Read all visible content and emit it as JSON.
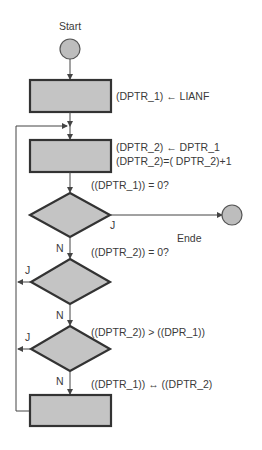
{
  "diagram": {
    "type": "flowchart",
    "colors": {
      "shape_fill": "#c4c4c4",
      "shape_stroke": "#333333",
      "circle_fill": "#bdbdbd",
      "line": "#444444",
      "text": "#3a3a3a"
    },
    "start": {
      "label": "Start"
    },
    "end": {
      "label": "Ende"
    },
    "steps": [
      {
        "id": "box1",
        "kind": "process",
        "lines": [
          "(DPTR_1)  ← LIANF"
        ]
      },
      {
        "id": "box2",
        "kind": "process",
        "lines": [
          "(DPTR_2)  ← DPTR_1",
          "(DPTR_2)=( DPTR_2)+1"
        ]
      },
      {
        "id": "dec1",
        "kind": "decision",
        "condition": "((DPTR_1)) = 0?",
        "yes_label": "J",
        "no_label": "N"
      },
      {
        "id": "dec2",
        "kind": "decision",
        "condition": "((DPTR_2)) = 0?",
        "yes_label": "J",
        "no_label": "N"
      },
      {
        "id": "dec3",
        "kind": "decision",
        "condition": "((DPTR_2)) > ((DPR_1))",
        "yes_label": "J",
        "no_label": "N"
      },
      {
        "id": "box3",
        "kind": "process",
        "lines": [
          "((DPTR_1))    ↔ ((DPTR_2)"
        ]
      }
    ]
  }
}
